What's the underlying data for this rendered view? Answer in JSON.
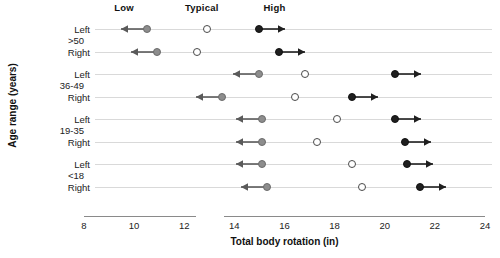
{
  "chart_data": {
    "type": "scatter",
    "title": "",
    "xlabel": "Total body rotation (in)",
    "ylabel": "Age range (years)",
    "xlim": [
      8,
      24
    ],
    "xticks": [
      8,
      10,
      12,
      14,
      16,
      18,
      20,
      22,
      24
    ],
    "xticklabels": [
      "8",
      "10",
      "12",
      "14",
      "16",
      "18",
      "20",
      "22",
      "24"
    ],
    "grid": true,
    "legend_position": "top",
    "column_headers": [
      {
        "label": "Low",
        "value": 9.6
      },
      {
        "label": "Typical",
        "value": 12.7
      },
      {
        "label": "High",
        "value": 15.6
      }
    ],
    "groups": [
      {
        "group": ">50",
        "rows": [
          {
            "label": "Left",
            "low": 10.5,
            "low_arrow": "left",
            "typical": 12.9,
            "high": 15.0,
            "high_arrow": "right"
          },
          {
            "label": "Right",
            "low": 10.9,
            "low_arrow": "left",
            "typical": 12.5,
            "high": 15.8,
            "high_arrow": "right"
          }
        ]
      },
      {
        "group": "36-49",
        "rows": [
          {
            "label": "Left",
            "low": 15.0,
            "low_arrow": "left",
            "typical": 16.8,
            "high": 20.4,
            "high_arrow": "right"
          },
          {
            "label": "Right",
            "low": 13.5,
            "low_arrow": "left",
            "typical": 16.4,
            "high": 18.7,
            "high_arrow": "right"
          }
        ]
      },
      {
        "group": "19-35",
        "rows": [
          {
            "label": "Left",
            "low": 15.1,
            "low_arrow": "left",
            "typical": 18.1,
            "high": 20.4,
            "high_arrow": "right"
          },
          {
            "label": "Right",
            "low": 15.1,
            "low_arrow": "left",
            "typical": 17.3,
            "high": 20.8,
            "high_arrow": "right"
          }
        ]
      },
      {
        "group": "<18",
        "rows": [
          {
            "label": "Left",
            "low": 15.1,
            "low_arrow": "left",
            "typical": 18.7,
            "high": 20.9,
            "high_arrow": "right"
          },
          {
            "label": "Right",
            "low": 15.3,
            "low_arrow": "left",
            "typical": 19.1,
            "high": 21.4,
            "high_arrow": "right"
          }
        ]
      }
    ],
    "series_legend": [
      {
        "name": "Low",
        "marker": "gray-filled-circle-with-left-arrow",
        "color": "#8d8d8d"
      },
      {
        "name": "Typical",
        "marker": "open-circle",
        "color": "#ffffff"
      },
      {
        "name": "High",
        "marker": "black-filled-circle-with-right-arrow",
        "color": "#1f1f1f"
      }
    ]
  },
  "colors": {
    "low": "#8d8d8d",
    "typical": "#ffffff",
    "high": "#1f1f1f",
    "gridline": "#d9d9d9",
    "axis": "#8a8a8a"
  }
}
